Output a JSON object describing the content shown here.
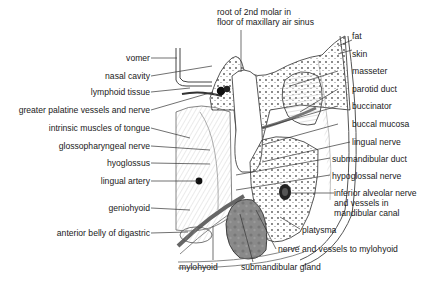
{
  "diagram": {
    "type": "anatomical cross-section (coronal section through mouth and mandible)",
    "labels_left": [
      {
        "id": "vomer",
        "text": "vomer"
      },
      {
        "id": "nasal-cavity",
        "text": "nasal cavity"
      },
      {
        "id": "lymphoid-tissue",
        "text": "lymphoid tissue"
      },
      {
        "id": "greater-palatine",
        "text": "greater palatine vessels and nerve"
      },
      {
        "id": "intrinsic-muscles",
        "text": "intrinsic muscles of tongue"
      },
      {
        "id": "glossopharyngeal",
        "text": "glossopharyngeal nerve"
      },
      {
        "id": "hyoglossus",
        "text": "hyoglossus"
      },
      {
        "id": "lingual-artery",
        "text": "lingual artery"
      },
      {
        "id": "geniohyoid",
        "text": "geniohyoid"
      },
      {
        "id": "digastric",
        "text": "anterior belly of digastric"
      }
    ],
    "labels_top": [
      {
        "id": "root-molar",
        "line1": "root of 2nd molar in",
        "line2": "floor of maxillary air sinus"
      }
    ],
    "labels_right": [
      {
        "id": "fat",
        "text": "fat"
      },
      {
        "id": "skin",
        "text": "skin"
      },
      {
        "id": "masseter",
        "text": "masseter"
      },
      {
        "id": "parotid-duct",
        "text": "parotid duct"
      },
      {
        "id": "buccinator",
        "text": "buccinator"
      },
      {
        "id": "buccal-mucosa",
        "text": "buccal mucosa"
      },
      {
        "id": "lingual-nerve",
        "text": "lingual nerve"
      },
      {
        "id": "submandibular-duct",
        "text": "submandibular duct"
      },
      {
        "id": "hypoglossal-nerve",
        "text": "hypoglossal nerve"
      },
      {
        "id": "inferior-alveolar",
        "line1": "inferior alveolar nerve",
        "line2": "and vessels in",
        "line3": "mandibular canal"
      },
      {
        "id": "platysma",
        "text": "platysma"
      },
      {
        "id": "mylohyoid-nerve",
        "text": "nerve and vessels to mylohyoid"
      }
    ],
    "labels_bottom": [
      {
        "id": "mylohyoid",
        "text": "mylohyoid"
      },
      {
        "id": "submandibular-gland",
        "text": "submandibular gland"
      }
    ]
  }
}
